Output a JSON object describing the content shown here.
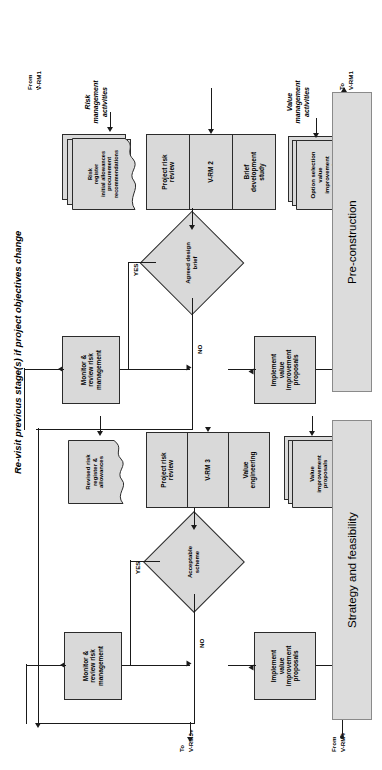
{
  "diagram": {
    "title_note": "Re-visit previous stage(s) if project objectives change",
    "orientation": "rotated-90-ccw",
    "phases": [
      {
        "id": "phase-strategy",
        "label": "Strategy and feasibility"
      },
      {
        "id": "phase-preconstruction",
        "label": "Pre-construction"
      }
    ],
    "swimlane_labels": {
      "value": "Value\nmanagement\nactivities",
      "risk": "Risk\nmanagement\nactivities"
    },
    "connector_labels": {
      "from_vrm1_a": "From",
      "from_vrm1_b": "V-RM1",
      "to_vrm1_a": "To",
      "to_vrm1_b": "V-RM1",
      "from_vrm4_a": "From",
      "from_vrm4_b": "V-RM4",
      "to_vrm3plus_a": "To",
      "to_vrm3plus_b": "V-RM3+"
    },
    "decision_labels": {
      "yes": "YES",
      "no": "NO"
    },
    "stages": [
      {
        "id": "stage-vrm2",
        "value_activity": "Brief\ndevelopment\nstudy",
        "code": "V-RM 2",
        "risk_activity": "Project risk\nreview"
      },
      {
        "id": "stage-vrm3",
        "value_activity": "Value\nengineering",
        "code": "V-RM 3",
        "risk_activity": "Project risk\nreview"
      }
    ],
    "decisions": [
      {
        "id": "decision-agreed-design-brief",
        "label": "Agreed design\nbrief"
      },
      {
        "id": "decision-acceptable-scheme",
        "label": "Acceptable\nscheme"
      }
    ],
    "documents": [
      {
        "id": "doc-option-selection",
        "label": "Option selection\nvalue\nimprovement\nproposals",
        "stacked": true
      },
      {
        "id": "doc-risk-register-initial",
        "label": "Risk\nregister\ninitial allowances\nprocurement\nrecommendations",
        "stacked": true
      },
      {
        "id": "doc-value-improvement",
        "label": "Value\nimprovement\nproposals",
        "stacked": true
      },
      {
        "id": "doc-revised-risk-register",
        "label": "Revised risk\nregister &\nallowances",
        "stacked": false
      }
    ],
    "processes": [
      {
        "id": "proc-implement-value-1",
        "label": "Implement\nvalue\nimprovement\nproposals"
      },
      {
        "id": "proc-monitor-risk-1",
        "label": "Monitor &\nreview risk\nmanagement"
      },
      {
        "id": "proc-implement-value-2",
        "label": "Implement\nvalue\nimprovement\nproposals"
      },
      {
        "id": "proc-monitor-risk-2",
        "label": "Monitor &\nreview risk\nmanagement"
      }
    ],
    "colors": {
      "fill": "#d9d9d9",
      "stroke": "#2b2b2b",
      "line": "#1a1a1a",
      "banner_fill": "#dcdcdc",
      "banner_stroke": "#8a8a8a",
      "background": "#ffffff"
    }
  }
}
